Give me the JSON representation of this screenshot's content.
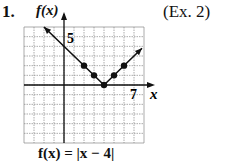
{
  "problem": {
    "number": "1.",
    "reference": "(Ex. 2)",
    "equation": "f(x) = |x − 4|"
  },
  "chart_data": {
    "type": "line",
    "title": "",
    "function": "f(x) = |x - 4|",
    "xlabel": "x",
    "ylabel": "f(x)",
    "xlim": [
      -4,
      8
    ],
    "ylim": [
      -6,
      6
    ],
    "grid": true,
    "tick_labels": [
      {
        "axis": "y",
        "value": 5,
        "label": "5"
      },
      {
        "axis": "x",
        "value": 7,
        "label": "7"
      }
    ],
    "points": [
      {
        "x": 2,
        "y": 2
      },
      {
        "x": 3,
        "y": 1
      },
      {
        "x": 4,
        "y": 0
      },
      {
        "x": 5,
        "y": 1
      },
      {
        "x": 6,
        "y": 2
      }
    ],
    "line_extent": [
      {
        "x": -2,
        "y": 6
      },
      {
        "x": 4,
        "y": 0
      },
      {
        "x": 7.8,
        "y": 3.8
      }
    ],
    "arrows": [
      "left-end",
      "right-end"
    ]
  },
  "labels": {
    "y_axis": "f(x)",
    "x_axis": "x",
    "y_tick": "5",
    "x_tick": "7"
  },
  "colors": {
    "ink": "#111111",
    "grid": "#888888",
    "background": "#ffffff"
  }
}
